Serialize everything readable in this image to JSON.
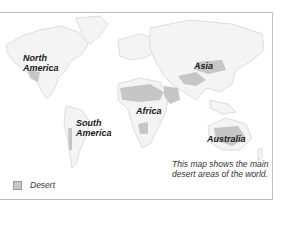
{
  "map": {
    "labels": {
      "north_america": [
        "North",
        "America"
      ],
      "south_america": [
        "South",
        "America"
      ],
      "africa": "Africa",
      "asia": "Asia",
      "australia": "Australia"
    },
    "caption": [
      "This map shows the main",
      "desert areas of the world."
    ],
    "legend": {
      "items": [
        {
          "label": "Desert",
          "color": "#c6c6c6"
        }
      ]
    },
    "colors": {
      "land": "#f4f4f4",
      "land_edge": "#d4d4d4",
      "desert": "#c6c6c6",
      "ocean": "#ffffff"
    }
  }
}
